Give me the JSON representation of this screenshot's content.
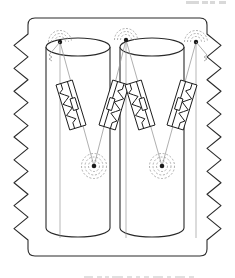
{
  "figure": {
    "title": "",
    "header_note": "",
    "caption": "",
    "background": "#ffffff",
    "ink": "#1a1a1a",
    "faint_ink": "#9a9a9a",
    "dash_ink": "#8c8c8c"
  },
  "frame": {
    "name": "broken-away-boundary",
    "description": "rectangular region with torn zigzag left and right edges",
    "left_x": 18,
    "right_x": 217,
    "top_y": 18,
    "bottom_y": 256,
    "zigzag_teeth": 9,
    "zigzag_amplitude": 14,
    "stroke": "#2a2a2a",
    "stroke_width": 1.1
  },
  "cylinders": [
    {
      "id": "left-cylinder",
      "label": "",
      "center_x": 78,
      "top_y": 47,
      "bottom_y": 237,
      "radius_x": 32,
      "radius_y": 9,
      "stroke": "#2a2a2a"
    },
    {
      "id": "right-cylinder",
      "label": "",
      "center_x": 152,
      "top_y": 47,
      "bottom_y": 237,
      "radius_x": 32,
      "radius_y": 9,
      "stroke": "#2a2a2a"
    }
  ],
  "anchors": {
    "top": [
      {
        "id": "top-anchor-left",
        "x": 60,
        "y": 42,
        "style": "radiating-arcs",
        "has_hook": true,
        "hook_side": "left"
      },
      {
        "id": "top-anchor-center",
        "x": 126,
        "y": 40,
        "style": "radiating-arcs",
        "has_hook": false,
        "hook_side": ""
      },
      {
        "id": "top-anchor-right",
        "x": 196,
        "y": 42,
        "style": "radiating-arcs",
        "has_hook": true,
        "hook_side": "right"
      }
    ],
    "bottom": [
      {
        "id": "bottom-anchor-left",
        "x": 94,
        "y": 166,
        "style": "concentric-dashed-rings",
        "rings": 3
      },
      {
        "id": "bottom-anchor-right",
        "x": 162,
        "y": 166,
        "style": "concentric-dashed-rings",
        "rings": 3
      }
    ]
  },
  "elements": [
    {
      "id": "spring-damper-L1",
      "cylinder": "left-cylinder",
      "type": "spring-damper-unit",
      "from_anchor": "top-anchor-left",
      "to_anchor": "bottom-anchor-left",
      "cx": 71,
      "cy": 105,
      "angle_deg": -17,
      "box_w": 17,
      "box_h": 47,
      "spring_side": "left",
      "damper_side": "right",
      "spring_coils": 6
    },
    {
      "id": "spring-damper-L2",
      "cylinder": "left-cylinder",
      "type": "spring-damper-unit",
      "from_anchor": "top-anchor-center",
      "to_anchor": "bottom-anchor-left",
      "cx": 114,
      "cy": 105,
      "angle_deg": 17,
      "box_w": 17,
      "box_h": 47,
      "spring_side": "right",
      "damper_side": "left",
      "spring_coils": 6
    },
    {
      "id": "spring-damper-R1",
      "cylinder": "right-cylinder",
      "type": "spring-damper-unit",
      "from_anchor": "top-anchor-center",
      "to_anchor": "bottom-anchor-right",
      "cx": 140,
      "cy": 105,
      "angle_deg": -17,
      "box_w": 17,
      "box_h": 47,
      "spring_side": "left",
      "damper_side": "right",
      "spring_coils": 6
    },
    {
      "id": "spring-damper-R2",
      "cylinder": "right-cylinder",
      "type": "spring-damper-unit",
      "from_anchor": "top-anchor-right",
      "to_anchor": "bottom-anchor-right",
      "cx": 182,
      "cy": 105,
      "angle_deg": 17,
      "box_w": 17,
      "box_h": 47,
      "spring_side": "right",
      "damper_side": "left",
      "spring_coils": 6
    }
  ],
  "header_marks": [
    {
      "x": 186,
      "w": 13
    },
    {
      "x": 202,
      "w": 6
    },
    {
      "x": 210,
      "w": 5
    },
    {
      "x": 219,
      "w": 7
    }
  ],
  "caption_marks": [
    {
      "x": 84,
      "w": 9
    },
    {
      "x": 97,
      "w": 5
    },
    {
      "x": 105,
      "w": 4
    },
    {
      "x": 112,
      "w": 11
    },
    {
      "x": 127,
      "w": 5
    },
    {
      "x": 136,
      "w": 4
    },
    {
      "x": 144,
      "w": 5
    },
    {
      "x": 153,
      "w": 10
    },
    {
      "x": 167,
      "w": 4
    },
    {
      "x": 175,
      "w": 10
    },
    {
      "x": 189,
      "w": 5
    }
  ]
}
